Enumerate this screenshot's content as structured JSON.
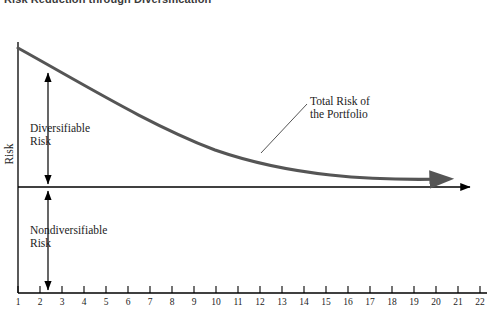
{
  "figure": {
    "title": "Risk Reduction through Diversification"
  },
  "chart_data": {
    "type": "line",
    "title": "Risk Reduction through Diversification",
    "xlabel": "",
    "ylabel": "Risk",
    "xlim": [
      1,
      22
    ],
    "ylim": [
      0,
      1
    ],
    "grid": false,
    "legend": false,
    "x": [
      1,
      2,
      3,
      4,
      5,
      6,
      7,
      8,
      9,
      10,
      11,
      12,
      13,
      14,
      15,
      16,
      17,
      18,
      19,
      20,
      21,
      22
    ],
    "xtick_labels": [
      "1",
      "2",
      "3",
      "4",
      "5",
      "6",
      "7",
      "8",
      "9",
      "10",
      "11",
      "12",
      "13",
      "14",
      "15",
      "16",
      "17",
      "18",
      "19",
      "20",
      "21",
      "22"
    ],
    "series": [
      {
        "name": "Total Risk of the Portfolio",
        "color": "#555555",
        "values": [
          1.0,
          0.915,
          0.84,
          0.775,
          0.715,
          0.662,
          0.615,
          0.573,
          0.535,
          0.502,
          0.472,
          0.446,
          0.423,
          0.403,
          0.386,
          0.371,
          0.358,
          0.347,
          0.338,
          0.33,
          0.324,
          0.32
        ]
      }
    ],
    "reference_line": {
      "name": "Nondiversifiable risk floor",
      "value": 0.3,
      "color": "#000000"
    },
    "annotations": [
      {
        "text": "Diversifiable\nRisk",
        "kind": "span-arrow",
        "from": 1.0,
        "to": 0.3
      },
      {
        "text": "Nondiversifiable\nRisk",
        "kind": "span-arrow",
        "from": 0.3,
        "to": 0.0
      },
      {
        "text": "Total Risk of\nthe Portfolio",
        "kind": "callout",
        "target_x": 12
      }
    ]
  },
  "annotations": {
    "diversifiable_line1": "Diversifiable",
    "diversifiable_line2": "Risk",
    "nondiversifiable_line1": "Nondiversifiable",
    "nondiversifiable_line2": "Risk",
    "total_risk_line1": "Total Risk of",
    "total_risk_line2": "the Portfolio"
  },
  "axes": {
    "y_label": "Risk",
    "x_tick_labels": [
      "1",
      "2",
      "3",
      "4",
      "5",
      "6",
      "7",
      "8",
      "9",
      "10",
      "11",
      "12",
      "13",
      "14",
      "15",
      "16",
      "17",
      "18",
      "19",
      "20",
      "21",
      "22"
    ]
  },
  "colors": {
    "curve": "#555555",
    "axis": "#000000",
    "text": "#1c1c1c",
    "title": "#3b3b3b"
  }
}
